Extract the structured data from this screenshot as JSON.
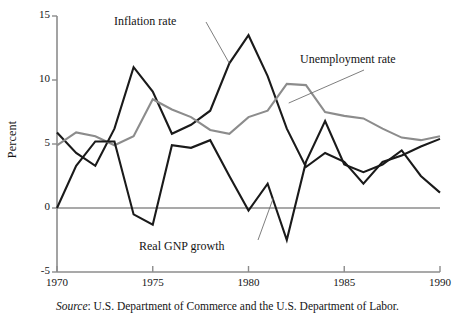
{
  "figure": {
    "ylabel": "Percent",
    "source_prefix": "Source",
    "source_text": ": U.S. Department of Commerce and the U.S. Department of Labor."
  },
  "chart_data": {
    "type": "line",
    "title": "",
    "xlabel": "",
    "ylabel": "Percent",
    "xlim": [
      1970,
      1990
    ],
    "ylim": [
      -5,
      15
    ],
    "yticks": [
      -5,
      0,
      5,
      10,
      15
    ],
    "xticks": [
      1970,
      1975,
      1980,
      1985,
      1990
    ],
    "ytick_labels": [
      "-5",
      "0",
      "5",
      "10",
      "15"
    ],
    "xtick_labels": [
      "1970",
      "1975",
      "1980",
      "1985",
      "1990"
    ],
    "grid": false,
    "legend": "annotated-inline",
    "zero_line": 0,
    "x": [
      1970,
      1971,
      1972,
      1973,
      1974,
      1975,
      1976,
      1977,
      1978,
      1979,
      1980,
      1981,
      1982,
      1983,
      1984,
      1985,
      1986,
      1987,
      1988,
      1989,
      1990
    ],
    "series": [
      {
        "name": "Inflation rate",
        "color": "#1a1a1a",
        "width": 2.1,
        "values": [
          5.9,
          4.3,
          3.3,
          6.2,
          11.0,
          9.1,
          5.8,
          6.5,
          7.6,
          11.3,
          13.5,
          10.3,
          6.2,
          3.2,
          4.3,
          3.6,
          1.9,
          3.6,
          4.1,
          4.8,
          5.4
        ]
      },
      {
        "name": "Unemployment rate",
        "color": "#8c8c8c",
        "width": 2.1,
        "values": [
          4.9,
          5.9,
          5.6,
          4.9,
          5.6,
          8.5,
          7.7,
          7.1,
          6.1,
          5.8,
          7.1,
          7.6,
          9.7,
          9.6,
          7.5,
          7.2,
          7.0,
          6.2,
          5.5,
          5.3,
          5.6
        ]
      },
      {
        "name": "Real GNP growth",
        "color": "#1a1a1a",
        "width": 2.1,
        "values": [
          0.0,
          3.3,
          5.2,
          5.2,
          -0.5,
          -1.3,
          4.9,
          4.7,
          5.3,
          2.5,
          -0.2,
          1.9,
          -2.5,
          3.6,
          6.8,
          3.4,
          2.8,
          3.4,
          4.5,
          2.5,
          1.2
        ]
      }
    ],
    "annotations": [
      {
        "text": "Inflation rate",
        "x_px": 114,
        "y_px": 14,
        "leader_to": [
          1979,
          11.3
        ]
      },
      {
        "text": "Unemployment rate",
        "x_px": 300,
        "y_px": 52,
        "leader_to": [
          1982.1,
          8.2
        ]
      },
      {
        "text": "Real GNP growth",
        "x_px": 139,
        "y_px": 239,
        "leader_to": [
          1981.3,
          0.8
        ]
      }
    ]
  }
}
